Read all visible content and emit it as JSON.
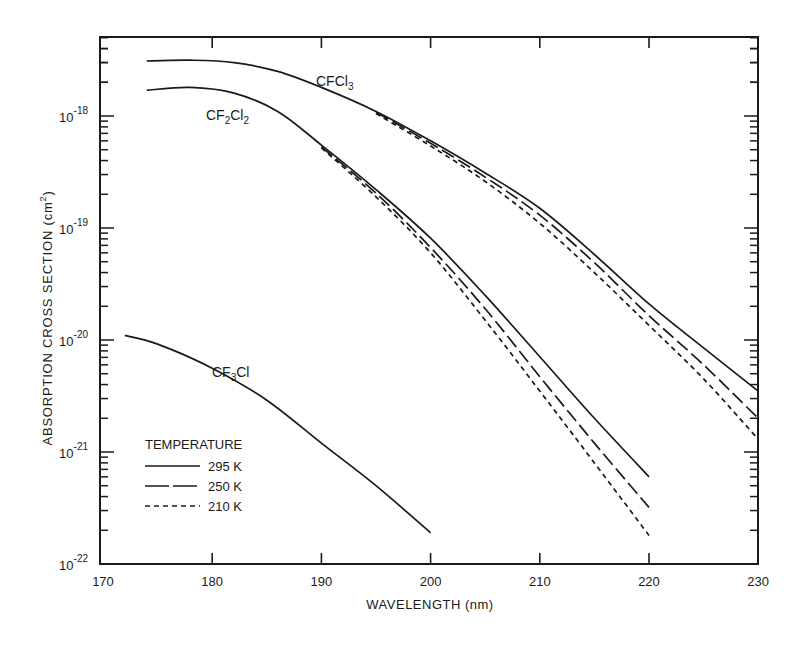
{
  "chart_data": {
    "type": "line",
    "title": "",
    "xlabel": "WAVELENGTH (nm)",
    "ylabel": "ABSORPTION CROSS SECTION (cm²)",
    "xlim": [
      170,
      230
    ],
    "ylim": [
      1e-22,
      5e-18
    ],
    "yscale": "log",
    "grid": false,
    "x_ticks": [
      170,
      180,
      190,
      200,
      210,
      220,
      230
    ],
    "y_ticks": [
      "10^-22",
      "10^-21",
      "10^-20",
      "10^-19",
      "10^-18"
    ],
    "y_tick_labels": [
      {
        "base": "10",
        "exp": "-22"
      },
      {
        "base": "10",
        "exp": "-21"
      },
      {
        "base": "10",
        "exp": "-20"
      },
      {
        "base": "10",
        "exp": "-19"
      },
      {
        "base": "10",
        "exp": "-18"
      }
    ],
    "legend": {
      "title": "TEMPERATURE",
      "position": "lower-left",
      "entries": [
        {
          "label": "295 K",
          "style": "solid"
        },
        {
          "label": "250 K",
          "style": "long-dash"
        },
        {
          "label": "210 K",
          "style": "short-dash"
        }
      ]
    },
    "annotations": [
      {
        "text": "CFCl3",
        "main": "CFCl",
        "sub": "3",
        "tail": "",
        "x_nm": 193,
        "sigma": 2.1e-18
      },
      {
        "text": "CF2Cl2",
        "main": "CF",
        "sub": "2",
        "tail": "Cl",
        "sub2": "2",
        "x_nm": 179,
        "sigma": 9.5e-19
      },
      {
        "text": "CF3Cl",
        "main": "CF",
        "sub": "3",
        "tail": "Cl",
        "x_nm": 183.5,
        "sigma": 5e-21
      }
    ],
    "series": [
      {
        "name": "CFCl3 295 K",
        "compound": "CFCl3",
        "temperature": "295 K",
        "style": "solid",
        "x": [
          174,
          178,
          182,
          186,
          190,
          195,
          200,
          205,
          210,
          215,
          220,
          225,
          230
        ],
        "y": [
          3.1e-18,
          3.15e-18,
          3e-18,
          2.5e-18,
          1.8e-18,
          1.1e-18,
          6e-19,
          3.1e-19,
          1.5e-19,
          5.8e-20,
          2.1e-20,
          8.5e-21,
          3.5e-21
        ]
      },
      {
        "name": "CFCl3 250 K",
        "compound": "CFCl3",
        "temperature": "250 K",
        "style": "long-dash",
        "x": [
          195,
          200,
          205,
          210,
          215,
          220,
          225,
          230
        ],
        "y": [
          1.08e-18,
          5.7e-19,
          2.85e-19,
          1.3e-19,
          4.9e-20,
          1.65e-20,
          6e-21,
          2e-21
        ]
      },
      {
        "name": "CFCl3 210 K",
        "compound": "CFCl3",
        "temperature": "210 K",
        "style": "short-dash",
        "x": [
          195,
          200,
          205,
          210,
          215,
          220,
          225,
          230
        ],
        "y": [
          1.05e-18,
          5.4e-19,
          2.6e-19,
          1.1e-19,
          4e-20,
          1.35e-20,
          4.5e-21,
          1.3e-21
        ]
      },
      {
        "name": "CF2Cl2 295 K",
        "compound": "CF2Cl2",
        "temperature": "295 K",
        "style": "solid",
        "x": [
          174,
          178,
          182,
          186,
          190,
          195,
          200,
          205,
          210,
          215,
          220
        ],
        "y": [
          1.7e-18,
          1.8e-18,
          1.6e-18,
          1.1e-18,
          5.5e-19,
          2.2e-19,
          8.1e-20,
          2.5e-20,
          7.1e-21,
          2e-21,
          6e-22
        ]
      },
      {
        "name": "CF2Cl2 250 K",
        "compound": "CF2Cl2",
        "temperature": "250 K",
        "style": "long-dash",
        "x": [
          190,
          195,
          200,
          205,
          210,
          215,
          220
        ],
        "y": [
          5.3e-19,
          2.05e-19,
          6.7e-20,
          1.9e-20,
          4.7e-21,
          1.2e-21,
          3.2e-22
        ]
      },
      {
        "name": "CF2Cl2 210 K",
        "compound": "CF2Cl2",
        "temperature": "210 K",
        "style": "short-dash",
        "x": [
          190,
          195,
          200,
          205,
          210,
          215,
          220
        ],
        "y": [
          5.2e-19,
          1.9e-19,
          6e-20,
          1.5e-20,
          3.5e-21,
          8e-22,
          1.8e-22
        ]
      },
      {
        "name": "CF3Cl 295 K",
        "compound": "CF3Cl",
        "temperature": "295 K",
        "style": "solid",
        "x": [
          172,
          175,
          180,
          185,
          190,
          195,
          200
        ],
        "y": [
          1.1e-20,
          9.2e-21,
          5.6e-21,
          2.9e-21,
          1.2e-21,
          5e-22,
          1.9e-22
        ]
      }
    ]
  },
  "axes": {
    "x_label": "WAVELENGTH (nm)",
    "y_label": "ABSORPTION CROSS SECTION (cm²)",
    "y_label_main": "ABSORPTION CROSS SECTION (cm",
    "y_label_sup": "2",
    "y_label_end": ")"
  },
  "legend": {
    "title": "TEMPERATURE",
    "items": [
      "295 K",
      "250 K",
      "210 K"
    ]
  },
  "colors": {
    "ink": "#1a1a1a",
    "background": "#ffffff"
  }
}
